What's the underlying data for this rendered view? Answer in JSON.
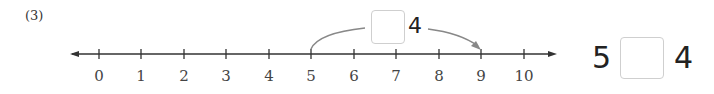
{
  "problem_number": "(3)",
  "number_line": {
    "min": 0,
    "max": 10,
    "ticks": [
      "0",
      "1",
      "2",
      "3",
      "4",
      "5",
      "6",
      "7",
      "8",
      "9",
      "10"
    ],
    "jump": {
      "from": 5,
      "to": 9
    }
  },
  "jump_label": {
    "blank": "",
    "suffix": "4"
  },
  "equation": {
    "left": "5",
    "blank": "",
    "right": "4"
  }
}
